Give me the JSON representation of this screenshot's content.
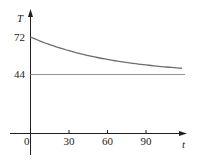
{
  "chart_data": {
    "type": "line",
    "title": "",
    "xlabel": "t",
    "ylabel": "T",
    "x_ticks": [
      0,
      30,
      60,
      90
    ],
    "y_ticks": [
      44,
      72
    ],
    "xlim": [
      0,
      120
    ],
    "ylim": [
      0,
      80
    ],
    "grid": false,
    "legend": null,
    "series": [
      {
        "name": "T(t) cooling curve",
        "x": [
          0,
          15,
          30,
          45,
          60,
          75,
          90,
          105,
          120
        ],
        "y": [
          72,
          66.9,
          61.7,
          58.2,
          55.3,
          52.9,
          51.1,
          49.6,
          48.5
        ],
        "color": "#6d6e71"
      },
      {
        "name": "asymptote T = 44",
        "x": [
          0,
          120
        ],
        "y": [
          44,
          44
        ],
        "color": "#939598"
      }
    ]
  },
  "labels": {
    "y_axis": "T",
    "x_axis": "t",
    "origin": "0",
    "x30": "30",
    "x60": "60",
    "x90": "90",
    "y72": "72",
    "y44": "44"
  }
}
